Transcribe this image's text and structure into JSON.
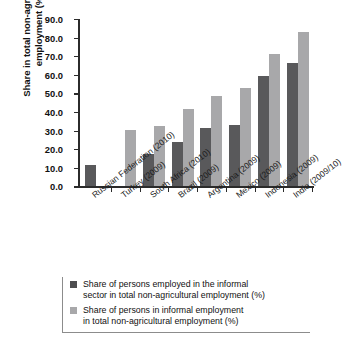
{
  "chart_data": {
    "type": "bar",
    "title": "",
    "xlabel": "",
    "ylabel": "Share in total non-agricultural employment (%)",
    "ylim": [
      0,
      90
    ],
    "ytick_labels": [
      "0.0",
      "10.0",
      "20.0",
      "30.0",
      "40.0",
      "50.0",
      "60.0",
      "70.0",
      "80.0",
      "90.0"
    ],
    "ytick_values": [
      0,
      10,
      20,
      30,
      40,
      50,
      60,
      70,
      80,
      90
    ],
    "grid": false,
    "legend_position": "bottom",
    "categories": [
      "Russian Federation (2010)",
      "Turkey (2009)",
      "South Africa (2010)",
      "Brazil (2009)",
      "Argentina (2009)",
      "Mexico (2009)",
      "Indonesia (2009)",
      "India (2009/10)"
    ],
    "series": [
      {
        "name": "Share of persons employed in the informal sector in total non-agricultural employment (%)",
        "color": "#59595b",
        "values": [
          11.3,
          null,
          17.2,
          23.7,
          31.2,
          32.9,
          59.3,
          66.3
        ]
      },
      {
        "name": "Share of persons in informal employment in total non-agricultural employment (%)",
        "color": "#a8a8aa",
        "values": [
          null,
          30.2,
          32.3,
          41.5,
          48.5,
          52.8,
          71.1,
          83.0
        ]
      }
    ]
  },
  "legend": {
    "entries": [
      {
        "line1": "Share of persons employed in the informal",
        "line2": "sector in total non-agricultural employment (%)",
        "swatch": "dark-swatch-icon"
      },
      {
        "line1": "Share of persons in informal employment",
        "line2": "in total non-agricultural employment (%)",
        "swatch": "light-swatch-icon"
      }
    ]
  }
}
